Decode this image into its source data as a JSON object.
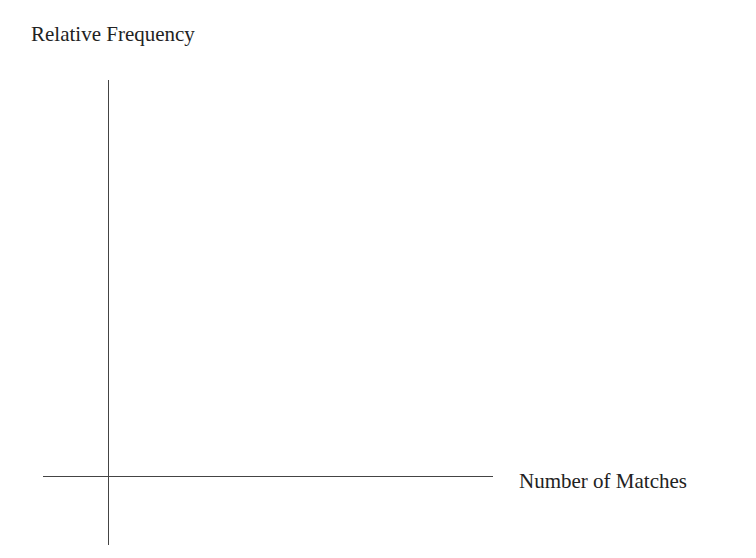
{
  "chart_data": {
    "type": "line",
    "title": "",
    "xlabel": "Number of Matches",
    "ylabel": "Relative Frequency",
    "x": [],
    "series": [],
    "grid": false,
    "legend": null,
    "note": "Blank axes with no data plotted"
  },
  "axes": {
    "y_label": "Relative Frequency",
    "x_label": "Number of Matches"
  },
  "colors": {
    "axis": "#444444",
    "text": "#222222",
    "background": "#ffffff"
  }
}
